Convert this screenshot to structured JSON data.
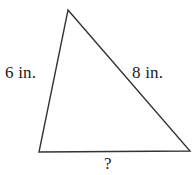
{
  "figure": {
    "type": "triangle-diagram",
    "background_color": "#ffffff",
    "stroke_color": "#333333",
    "stroke_width": 1.4,
    "vertices": {
      "apex": {
        "x": 68,
        "y": 10
      },
      "bottom_left": {
        "x": 39,
        "y": 152
      },
      "bottom_right": {
        "x": 190,
        "y": 151
      }
    },
    "labels": {
      "left_side": "6 in.",
      "right_side": "8 in.",
      "bottom_side": "?"
    }
  }
}
